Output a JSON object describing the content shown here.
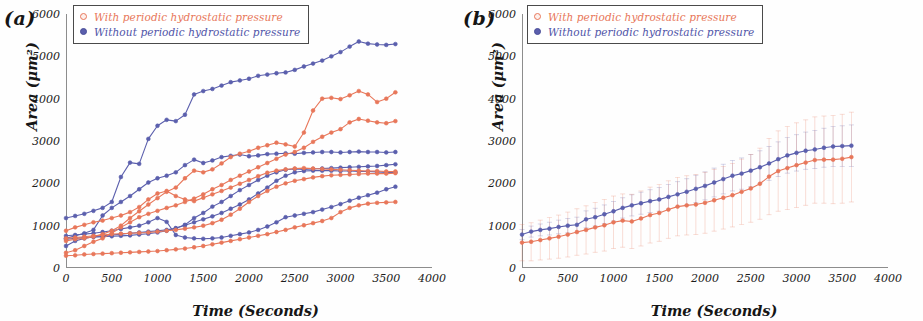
{
  "figure": {
    "panels": [
      {
        "id": "a",
        "label": "(a)",
        "xlabel": "Time (Seconds)",
        "ylabel": "Area (μm²)"
      },
      {
        "id": "b",
        "label": "(b)",
        "xlabel": "Time (Seconds)",
        "ylabel": "Area (μm²)"
      }
    ],
    "legend": {
      "with_label": "With periodic hydrostatic pressure",
      "without_label": "Without periodic hydrostatic pressure",
      "with_color": "#e8775a",
      "without_color": "#5b5fad",
      "with_marker": "open-circle-marker",
      "without_marker": "filled-circle-marker"
    }
  },
  "chart_data": [
    {
      "type": "line",
      "panel": "a",
      "title": "(a)",
      "xlabel": "Time (Seconds)",
      "ylabel": "Area (μm²)",
      "xlim": [
        0,
        4000
      ],
      "ylim": [
        0,
        6000
      ],
      "xticks": [
        0,
        500,
        1000,
        1500,
        2000,
        2500,
        3000,
        3500,
        4000
      ],
      "yticks": [
        0,
        1000,
        2000,
        3000,
        4000,
        5000,
        6000
      ],
      "grid": false,
      "legend_position": "top-left",
      "x": [
        0,
        100,
        200,
        300,
        400,
        500,
        600,
        700,
        800,
        900,
        1000,
        1100,
        1200,
        1300,
        1400,
        1500,
        1600,
        1700,
        1800,
        1900,
        2000,
        2100,
        2200,
        2300,
        2400,
        2500,
        2600,
        2700,
        2800,
        2900,
        3000,
        3100,
        3200,
        3300,
        3400,
        3500,
        3600
      ],
      "series": [
        {
          "name": "Without periodic hydrostatic pressure - cell 1",
          "group": "without",
          "color": "#5b5fad",
          "values": [
            1180,
            1230,
            1280,
            1350,
            1420,
            1560,
            2150,
            2490,
            2460,
            3050,
            3360,
            3500,
            3470,
            3620,
            4100,
            4180,
            4230,
            4310,
            4390,
            4430,
            4470,
            4540,
            4570,
            4600,
            4620,
            4680,
            4760,
            4830,
            4900,
            5000,
            5100,
            5230,
            5350,
            5300,
            5280,
            5270,
            5290
          ]
        },
        {
          "name": "Without periodic hydrostatic pressure - cell 2",
          "group": "without",
          "color": "#5b5fad",
          "values": [
            700,
            760,
            820,
            900,
            1240,
            1420,
            1560,
            1700,
            1860,
            2020,
            2120,
            2180,
            2260,
            2430,
            2560,
            2480,
            2540,
            2620,
            2650,
            2680,
            2640,
            2660,
            2690,
            2700,
            2710,
            2700,
            2720,
            2730,
            2740,
            2740,
            2730,
            2740,
            2750,
            2740,
            2740,
            2730,
            2740
          ]
        },
        {
          "name": "Without periodic hydrostatic pressure - cell 3",
          "group": "without",
          "color": "#5b5fad",
          "values": [
            520,
            640,
            700,
            740,
            760,
            780,
            800,
            820,
            840,
            860,
            880,
            900,
            940,
            1020,
            1180,
            1300,
            1450,
            1560,
            1700,
            1840,
            1960,
            2080,
            2180,
            2260,
            2320,
            2340,
            2330,
            2340,
            2350,
            2360,
            2370,
            2380,
            2390,
            2400,
            2410,
            2430,
            2450
          ]
        },
        {
          "name": "Without periodic hydrostatic pressure - cell 4",
          "group": "without",
          "color": "#5b5fad",
          "values": [
            680,
            700,
            720,
            730,
            740,
            750,
            760,
            770,
            790,
            810,
            840,
            880,
            940,
            1010,
            1080,
            1150,
            1220,
            1300,
            1400,
            1500,
            1620,
            1760,
            1900,
            2060,
            2180,
            2260,
            2290,
            2300,
            2300,
            2300,
            2290,
            2290,
            2280,
            2280,
            2270,
            2260,
            2260
          ]
        },
        {
          "name": "Without periodic hydrostatic pressure - cell 5",
          "group": "without",
          "color": "#5b5fad",
          "values": [
            760,
            780,
            800,
            820,
            850,
            880,
            920,
            960,
            1000,
            1080,
            1180,
            1090,
            780,
            720,
            700,
            690,
            700,
            720,
            760,
            800,
            840,
            900,
            980,
            1080,
            1200,
            1240,
            1280,
            1320,
            1380,
            1440,
            1510,
            1590,
            1660,
            1720,
            1780,
            1860,
            1920
          ]
        },
        {
          "name": "With periodic hydrostatic pressure - cell 1",
          "group": "with",
          "color": "#e8775a",
          "values": [
            640,
            680,
            700,
            740,
            800,
            880,
            1000,
            1180,
            1340,
            1500,
            1650,
            1800,
            1900,
            2120,
            2300,
            2260,
            2330,
            2470,
            2620,
            2700,
            2760,
            2840,
            2900,
            2960,
            2920,
            2870,
            3200,
            3720,
            4000,
            4020,
            3990,
            4080,
            4180,
            4100,
            3920,
            4000,
            4150
          ]
        },
        {
          "name": "With periodic hydrostatic pressure - cell 2",
          "group": "with",
          "color": "#e8775a",
          "values": [
            360,
            420,
            520,
            620,
            700,
            820,
            960,
            1080,
            1200,
            1280,
            1350,
            1420,
            1480,
            1560,
            1640,
            1740,
            1860,
            1960,
            2080,
            2180,
            2280,
            2380,
            2480,
            2580,
            2680,
            2740,
            2840,
            2980,
            3100,
            3200,
            3280,
            3440,
            3520,
            3480,
            3440,
            3420,
            3470
          ]
        },
        {
          "name": "With periodic hydrostatic pressure - cell 3",
          "group": "with",
          "color": "#e8775a",
          "values": [
            880,
            960,
            1020,
            1080,
            1120,
            1180,
            1240,
            1320,
            1440,
            1620,
            1760,
            1820,
            1700,
            1620,
            1580,
            1660,
            1740,
            1820,
            1900,
            1990,
            2080,
            2170,
            2250,
            2300,
            2330,
            2350,
            2360,
            2350,
            2340,
            2330,
            2320,
            2310,
            2300,
            2290,
            2290,
            2280,
            2280
          ]
        },
        {
          "name": "With periodic hydrostatic pressure - cell 4",
          "group": "with",
          "color": "#e8775a",
          "values": [
            700,
            720,
            740,
            760,
            780,
            800,
            810,
            820,
            830,
            840,
            860,
            880,
            900,
            930,
            960,
            1000,
            1060,
            1140,
            1260,
            1400,
            1560,
            1700,
            1820,
            1920,
            2000,
            2060,
            2100,
            2140,
            2170,
            2190,
            2200,
            2210,
            2220,
            2230,
            2230,
            2230,
            2240
          ]
        },
        {
          "name": "With periodic hydrostatic pressure - cell 5",
          "group": "with",
          "color": "#e8775a",
          "values": [
            290,
            300,
            320,
            330,
            340,
            350,
            360,
            370,
            380,
            390,
            400,
            420,
            440,
            460,
            490,
            520,
            560,
            600,
            640,
            680,
            720,
            760,
            800,
            850,
            900,
            960,
            1010,
            1060,
            1110,
            1180,
            1320,
            1420,
            1480,
            1520,
            1540,
            1550,
            1560
          ]
        }
      ]
    },
    {
      "type": "line",
      "panel": "b",
      "title": "(b)",
      "xlabel": "Time (Seconds)",
      "ylabel": "Area (μm²)",
      "xlim": [
        0,
        4000
      ],
      "ylim": [
        0,
        6000
      ],
      "xticks": [
        0,
        500,
        1000,
        1500,
        2000,
        2500,
        3000,
        3500,
        4000
      ],
      "yticks": [
        0,
        1000,
        2000,
        3000,
        4000,
        5000,
        6000
      ],
      "grid": false,
      "legend_position": "top-left",
      "error_bars": true,
      "x": [
        0,
        100,
        200,
        300,
        400,
        500,
        600,
        700,
        800,
        900,
        1000,
        1100,
        1200,
        1300,
        1400,
        1500,
        1600,
        1700,
        1800,
        1900,
        2000,
        2100,
        2200,
        2300,
        2400,
        2500,
        2600,
        2700,
        2800,
        2900,
        3000,
        3100,
        3200,
        3300,
        3400,
        3500,
        3600
      ],
      "series": [
        {
          "name": "Without periodic hydrostatic pressure (mean)",
          "group": "without",
          "color": "#5b5fad",
          "values": [
            790,
            860,
            900,
            930,
            970,
            1000,
            1020,
            1150,
            1200,
            1270,
            1340,
            1420,
            1480,
            1530,
            1580,
            1620,
            1680,
            1740,
            1800,
            1870,
            1940,
            2020,
            2100,
            2180,
            2230,
            2300,
            2380,
            2470,
            2570,
            2660,
            2720,
            2770,
            2800,
            2840,
            2870,
            2880,
            2890
          ],
          "errors": [
            120,
            130,
            140,
            150,
            160,
            170,
            180,
            200,
            210,
            220,
            230,
            240,
            250,
            260,
            270,
            280,
            290,
            300,
            310,
            320,
            330,
            340,
            350,
            360,
            370,
            380,
            390,
            400,
            410,
            420,
            430,
            440,
            450,
            460,
            470,
            480,
            490
          ]
        },
        {
          "name": "With periodic hydrostatic pressure (mean)",
          "group": "with",
          "color": "#e8775a",
          "values": [
            600,
            620,
            660,
            700,
            740,
            790,
            850,
            900,
            960,
            1010,
            1080,
            1120,
            1100,
            1170,
            1250,
            1300,
            1380,
            1450,
            1480,
            1500,
            1540,
            1600,
            1660,
            1720,
            1800,
            1880,
            1990,
            2160,
            2290,
            2360,
            2430,
            2490,
            2550,
            2560,
            2560,
            2580,
            2620
          ],
          "errors": [
            430,
            450,
            470,
            490,
            510,
            530,
            550,
            570,
            590,
            610,
            620,
            630,
            640,
            650,
            660,
            670,
            680,
            690,
            700,
            710,
            720,
            730,
            740,
            750,
            770,
            800,
            840,
            900,
            950,
            980,
            1000,
            1010,
            1020,
            1030,
            1040,
            1050,
            1060
          ]
        }
      ]
    }
  ]
}
